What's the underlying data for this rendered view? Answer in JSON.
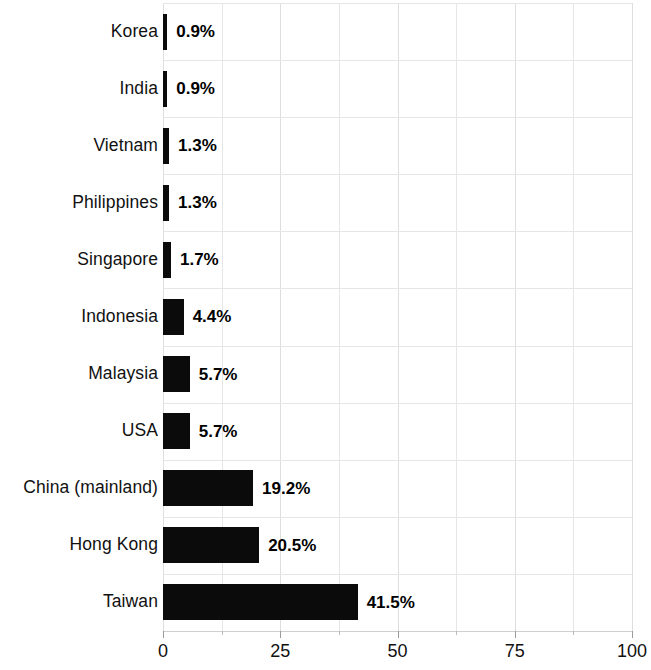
{
  "chart_data": {
    "type": "bar",
    "orientation": "horizontal",
    "title": "",
    "subtitle": "",
    "xlabel": "",
    "ylabel": "",
    "categories": [
      "Korea",
      "India",
      "Vietnam",
      "Philippines",
      "Singapore",
      "Indonesia",
      "Malaysia",
      "USA",
      "China (mainland)",
      "Hong Kong",
      "Taiwan"
    ],
    "values": [
      0.9,
      0.9,
      1.3,
      1.3,
      1.7,
      4.4,
      5.7,
      5.7,
      19.2,
      20.5,
      41.5
    ],
    "value_labels": [
      "0.9%",
      "0.9%",
      "1.3%",
      "1.3%",
      "1.7%",
      "4.4%",
      "5.7%",
      "5.7%",
      "19.2%",
      "20.5%",
      "41.5%"
    ],
    "xlim": [
      0,
      100
    ],
    "xticks": [
      0,
      25,
      50,
      75,
      100
    ],
    "xtick_labels": [
      "0",
      "25",
      "50",
      "75",
      "100"
    ],
    "minor_xticks": [
      12.5,
      37.5,
      62.5,
      87.5
    ],
    "grid": {
      "vertical": true,
      "horizontal": true,
      "vertical_interval": 12.5,
      "color": "#e6e6e6"
    },
    "legend": null,
    "bar_color": "#0b0b0b",
    "background_color": "#ffffff",
    "value_label_position": "outside-end"
  }
}
